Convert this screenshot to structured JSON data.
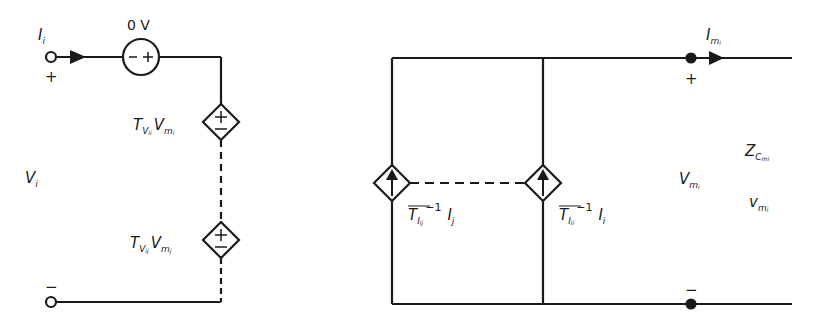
{
  "colors": {
    "ink": "#1a1a1a",
    "background": "#ffffff"
  },
  "left_circuit": {
    "input_current": {
      "symbol": "I",
      "sub": "i"
    },
    "plus_sign": "+",
    "minus_sign": "−",
    "input_voltage": {
      "symbol": "V",
      "sub": "i"
    },
    "source_label": "0 V",
    "source_signs": "−+",
    "dep_source_1": {
      "symbol": "T",
      "sub": "V",
      "subsub": "ii",
      "var": "V",
      "var_sub": "m",
      "var_subsub": "i",
      "signs": [
        "+",
        "−"
      ]
    },
    "dep_source_2": {
      "symbol": "T",
      "sub": "V",
      "subsub": "ij",
      "var": "V",
      "var_sub": "m",
      "var_subsub": "j",
      "signs": [
        "+",
        "−"
      ]
    }
  },
  "right_circuit": {
    "dep_current_1": {
      "symbol": "T",
      "sub": "I",
      "subsub": "ij",
      "exp": "−1",
      "var": "I",
      "var_sub": "j"
    },
    "dep_current_2": {
      "symbol": "T",
      "sub": "I",
      "subsub": "ii",
      "exp": "−1",
      "var": "I",
      "var_sub": "i"
    },
    "output_current": {
      "symbol": "I",
      "sub": "m",
      "subsub": "i"
    },
    "plus_sign": "+",
    "minus_sign": "−",
    "output_voltage": {
      "symbol": "V",
      "sub": "m",
      "subsub": "i"
    },
    "impedance": {
      "symbol": "Z",
      "sub": "C",
      "subsub": "mi"
    },
    "small_voltage": {
      "symbol": "v",
      "sub": "m",
      "subsub": "i"
    }
  }
}
